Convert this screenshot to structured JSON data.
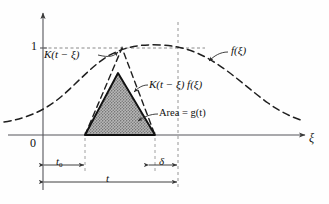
{
  "figure": {
    "axes": {
      "x_axis_label": "ξ",
      "y_tick_label": "1",
      "origin_label": "0",
      "x_axis_y": 135,
      "y_axis_x": 43,
      "unit_y": 48
    },
    "labels": [
      {
        "id": "kernel",
        "text": "K(t − ξ)",
        "x": 48,
        "y": 56
      },
      {
        "id": "forcing",
        "text": "f(ξ)",
        "x": 230,
        "y": 52
      },
      {
        "id": "product",
        "text": "K(t − ξ) f(ξ)",
        "x": 150,
        "y": 86
      },
      {
        "id": "area",
        "text": "Area = g(t)",
        "x": 160,
        "y": 115
      },
      {
        "id": "origin",
        "text": "0",
        "x": 33,
        "y": 144
      },
      {
        "id": "unit",
        "text": "1",
        "x": 33,
        "y": 42
      },
      {
        "id": "xi",
        "text": "ξ",
        "x": 310,
        "y": 140
      },
      {
        "id": "t0",
        "text": "t",
        "sub": "0",
        "x": 57,
        "y": 160
      },
      {
        "id": "delta",
        "text": "δ",
        "x": 160,
        "y": 160
      },
      {
        "id": "t",
        "text": "t",
        "x": 108,
        "y": 176
      }
    ],
    "dimension_lines": [
      {
        "id": "t0-dimension",
        "from_x": 43,
        "to_x": 85,
        "y": 165,
        "label": "t₀"
      },
      {
        "id": "delta-dimension",
        "from_x": 148,
        "to_x": 178,
        "y": 165,
        "label": "δ"
      },
      {
        "id": "t-dimension",
        "from_x": 43,
        "to_x": 178,
        "y": 182,
        "label": "t"
      }
    ],
    "curves": {
      "f_xi": {
        "name": "f(ξ)",
        "style": "dashed",
        "peak_x": 160,
        "peak_y": 47,
        "description": "bell-shaped forcing function, peak value near 1"
      },
      "kernel_triangle": {
        "name": "K(t − ξ)",
        "style": "dashed",
        "left_x": 85,
        "apex_x": 122,
        "apex_y": 48,
        "right_x": 155,
        "base_y": 135,
        "description": "reflected triangular kernel with apex at value 1"
      },
      "product_triangle": {
        "name": "K(t − ξ) f(ξ)",
        "style": "solid-shaded",
        "left_x": 85,
        "apex_x": 118,
        "apex_y": 73,
        "right_x": 155,
        "base_y": 135,
        "fill": "hatched-gray",
        "description": "shaded product region whose area equals g(t)"
      }
    },
    "guide_lines": [
      {
        "id": "unit-guide",
        "orientation": "horizontal",
        "y": 48,
        "from_x": 43,
        "to_x": 205,
        "style": "dashed"
      },
      {
        "id": "t-guide",
        "orientation": "vertical",
        "x": 178,
        "from_y": 22,
        "to_y": 188,
        "style": "dashed"
      },
      {
        "id": "left-guide",
        "orientation": "vertical",
        "x": 85,
        "from_y": 135,
        "to_y": 172,
        "style": "dashed"
      },
      {
        "id": "right-guide",
        "orientation": "vertical",
        "x": 155,
        "from_y": 135,
        "to_y": 172,
        "style": "dashed"
      }
    ],
    "colors": {
      "ink": "#1a1a1a",
      "axis": "#55555a",
      "shade_fill": "#9a9a9a",
      "background": "#fefefe"
    }
  }
}
